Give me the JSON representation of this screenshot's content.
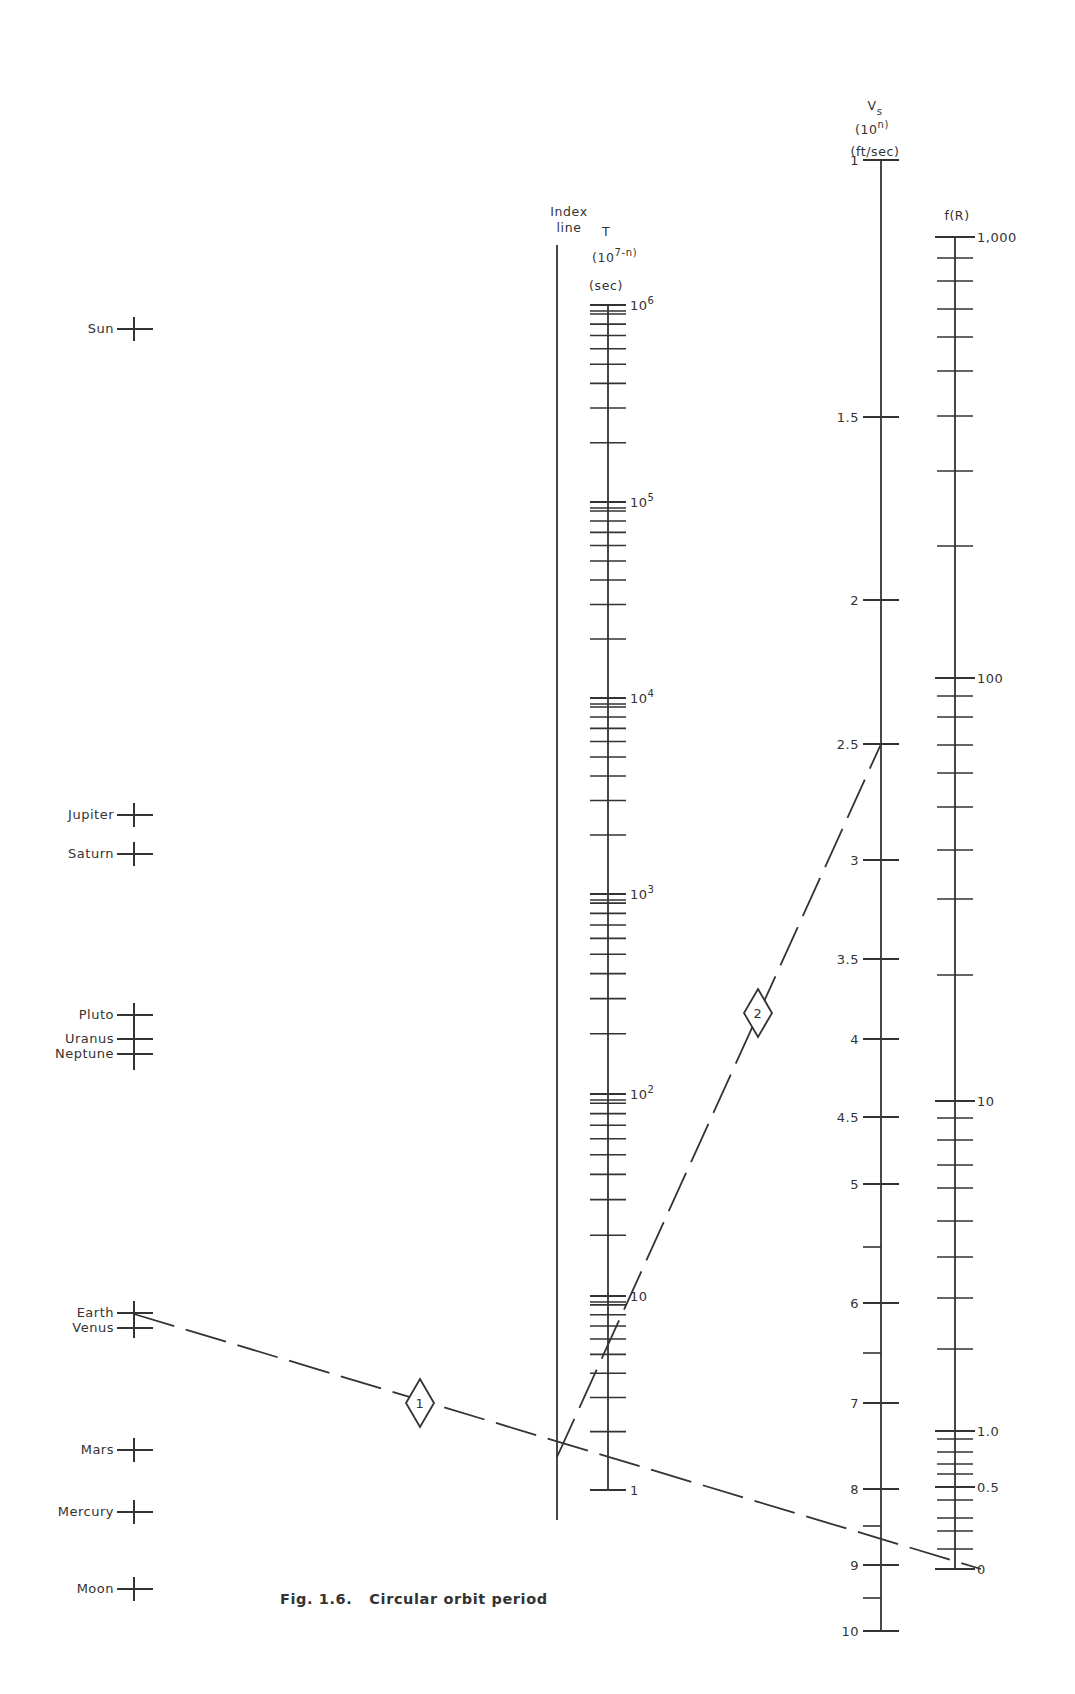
{
  "caption": "Fig. 1.6.   Circular orbit period",
  "index_line": {
    "label_line1": "Index",
    "label_line2": "line",
    "x": 557,
    "y_top": 245,
    "y_bottom": 1520
  },
  "planet_axis": {
    "x": 134,
    "bodies": [
      {
        "name": "Sun",
        "y": 329
      },
      {
        "name": "Jupiter",
        "y": 815
      },
      {
        "name": "Saturn",
        "y": 854
      },
      {
        "name": "Pluto",
        "y": 1015
      },
      {
        "name": "Uranus",
        "y": 1039
      },
      {
        "name": "Neptune",
        "y": 1054,
        "cross_y": 1058
      },
      {
        "name": "Earth",
        "y": 1313
      },
      {
        "name": "Venus",
        "y": 1328,
        "cross_y": 1326
      },
      {
        "name": "Mars",
        "y": 1450
      },
      {
        "name": "Mercury",
        "y": 1512
      },
      {
        "name": "Moon",
        "y": 1589
      }
    ]
  },
  "t_scale": {
    "title": "T",
    "unit_base": "(10",
    "unit_exp": "7-n",
    "unit_close": ")",
    "unit_sec": "(sec)",
    "x": 608,
    "y_top": 305,
    "y_bottom": 1490,
    "decades": [
      {
        "label": "10",
        "exp": "6",
        "y": 305
      },
      {
        "label": "10",
        "exp": "5",
        "y": 502
      },
      {
        "label": "10",
        "exp": "4",
        "y": 698
      },
      {
        "label": "10",
        "exp": "3",
        "y": 894
      },
      {
        "label": "10",
        "exp": "2",
        "y": 1094
      },
      {
        "label": "10",
        "exp": "",
        "y": 1296
      },
      {
        "label": "1",
        "exp": "",
        "y": 1490
      }
    ]
  },
  "vs_scale": {
    "title": "V",
    "title_sub": "s",
    "unit_base": "(10",
    "unit_exp": "n",
    "unit_close": ")",
    "unit_fps": "(ft/sec)",
    "x": 881,
    "y_top": 160,
    "y_bottom": 1631,
    "ticks": [
      {
        "label": "1",
        "y": 160
      },
      {
        "label": "1.5",
        "y": 417
      },
      {
        "label": "2",
        "y": 600
      },
      {
        "label": "2.5",
        "y": 744
      },
      {
        "label": "3",
        "y": 860
      },
      {
        "label": "3.5",
        "y": 959
      },
      {
        "label": "4",
        "y": 1039
      },
      {
        "label": "4.5",
        "y": 1117
      },
      {
        "label": "5",
        "y": 1184
      },
      {
        "label": "",
        "y": 1247,
        "half": true
      },
      {
        "label": "6",
        "y": 1303
      },
      {
        "label": "",
        "y": 1353,
        "half": true
      },
      {
        "label": "7",
        "y": 1403
      },
      {
        "label": "8",
        "y": 1489
      },
      {
        "label": "",
        "y": 1526,
        "half": true
      },
      {
        "label": "9",
        "y": 1565
      },
      {
        "label": "",
        "y": 1598,
        "half": true
      },
      {
        "label": "10",
        "y": 1631
      }
    ]
  },
  "fr_scale": {
    "title": "f(R)",
    "x": 955,
    "y_top": 237,
    "y_bottom": 1569,
    "labeled": [
      {
        "label": "1,000",
        "y": 237
      },
      {
        "label": "100",
        "y": 678
      },
      {
        "label": "10",
        "y": 1101
      },
      {
        "label": "1.0",
        "y": 1431
      },
      {
        "label": "0.5",
        "y": 1487
      },
      {
        "label": "0",
        "y": 1569
      }
    ],
    "minor_ticks": [
      258,
      281,
      309,
      337,
      371,
      416,
      471,
      546,
      696,
      717,
      745,
      773,
      807,
      850,
      899,
      975,
      1118,
      1140,
      1165,
      1188,
      1221,
      1257,
      1298,
      1349,
      1439,
      1452,
      1464,
      1474,
      1500,
      1518,
      1531,
      1549
    ]
  },
  "construction_lines": [
    {
      "id": "1",
      "label": "1",
      "from": [
        134,
        1314
      ],
      "to": [
        981,
        1569
      ],
      "marker": [
        420,
        1403
      ]
    },
    {
      "id": "2",
      "label": "2",
      "from": [
        557,
        1457
      ],
      "to": [
        881,
        744
      ],
      "marker": [
        758,
        1013
      ]
    }
  ],
  "colors": {
    "ink": "#333333",
    "background": "#ffffff"
  }
}
